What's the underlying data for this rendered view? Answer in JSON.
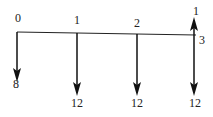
{
  "diagram": {
    "type": "cash-flow-diagram",
    "periods": [
      "0",
      "1",
      "2",
      "3"
    ],
    "flows": [
      {
        "period": "0",
        "direction": "down",
        "amount": "8"
      },
      {
        "period": "1",
        "direction": "down",
        "amount": "12"
      },
      {
        "period": "2",
        "direction": "down",
        "amount": "12"
      },
      {
        "period": "3",
        "direction": "up",
        "amount": "1"
      },
      {
        "period": "3",
        "direction": "down",
        "amount": "12"
      }
    ]
  }
}
